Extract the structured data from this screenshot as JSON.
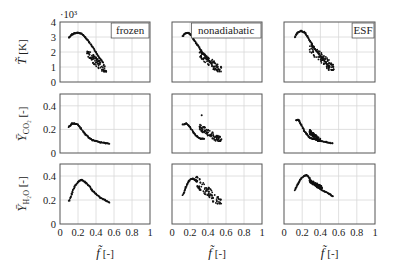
{
  "figure": {
    "columns": [
      "frozen",
      "nonadiabatic",
      "ESF"
    ],
    "row_labels": [
      {
        "symbol": "T",
        "unit": "[K]",
        "exponent": "·10³"
      },
      {
        "symbol": "Y",
        "sub": "CO₂",
        "unit": "[-]"
      },
      {
        "symbol": "Y",
        "sub": "H₂O",
        "unit": "[-]"
      }
    ],
    "x_label": {
      "symbol": "f",
      "unit": "[-]"
    },
    "x_ticks": [
      "0",
      "0.2",
      "0.4",
      "0.6",
      "0.8",
      "1"
    ],
    "y_ticks": [
      [
        "0",
        "1",
        "2",
        "3",
        "4"
      ],
      [
        "0",
        "0.2",
        "0.4"
      ],
      [
        "0",
        "0.2",
        "0.4"
      ]
    ],
    "colors": {
      "points": "#111111",
      "grid": "#d8d8d8",
      "frame": "#555555"
    }
  },
  "chart_data": [
    {
      "type": "scatter",
      "title": "frozen",
      "row": 0,
      "col": 0,
      "xlabel": "f̃ [-]",
      "ylabel": "T̃ [K] ·10³",
      "xlim": [
        0,
        1
      ],
      "ylim": [
        0,
        4
      ],
      "grid": true,
      "legend": "frozen",
      "legend_position": "upper right",
      "curve": [
        [
          0.1,
          2.95
        ],
        [
          0.13,
          3.15
        ],
        [
          0.16,
          3.25
        ],
        [
          0.2,
          3.28
        ],
        [
          0.24,
          3.22
        ],
        [
          0.28,
          3.0
        ],
        [
          0.32,
          2.7
        ],
        [
          0.36,
          2.35
        ],
        [
          0.4,
          2.0
        ],
        [
          0.44,
          1.6
        ],
        [
          0.48,
          1.3
        ]
      ],
      "scatter_region": {
        "x": [
          0.3,
          0.52
        ],
        "y": [
          0.7,
          1.9
        ]
      }
    },
    {
      "type": "scatter",
      "title": "nonadiabatic",
      "row": 0,
      "col": 1,
      "xlim": [
        0,
        1
      ],
      "ylim": [
        0,
        4
      ],
      "grid": true,
      "legend": "nonadiabatic",
      "curve": [
        [
          0.12,
          3.05
        ],
        [
          0.15,
          3.25
        ],
        [
          0.18,
          3.28
        ],
        [
          0.21,
          3.15
        ],
        [
          0.24,
          2.85
        ],
        [
          0.28,
          2.5
        ],
        [
          0.32,
          2.15
        ],
        [
          0.36,
          1.8
        ],
        [
          0.4,
          1.5
        ],
        [
          0.44,
          1.2
        ]
      ],
      "scatter_region": {
        "x": [
          0.3,
          0.55
        ],
        "y": [
          0.7,
          1.9
        ]
      }
    },
    {
      "type": "scatter",
      "title": "ESF",
      "row": 0,
      "col": 2,
      "xlim": [
        0,
        1
      ],
      "ylim": [
        0,
        4
      ],
      "grid": true,
      "legend": "ESF",
      "curve": [
        [
          0.12,
          3.0
        ],
        [
          0.15,
          3.3
        ],
        [
          0.19,
          3.4
        ],
        [
          0.23,
          3.3
        ],
        [
          0.26,
          3.0
        ],
        [
          0.3,
          2.6
        ],
        [
          0.34,
          2.2
        ],
        [
          0.38,
          1.9
        ],
        [
          0.42,
          1.6
        ],
        [
          0.46,
          1.3
        ],
        [
          0.5,
          1.0
        ]
      ],
      "scatter_region": {
        "x": [
          0.28,
          0.55
        ],
        "y": [
          0.8,
          2.3
        ]
      }
    },
    {
      "type": "scatter",
      "row": 1,
      "col": 0,
      "ylabel": "Ȳ_CO2 [-]",
      "xlim": [
        0,
        1
      ],
      "ylim": [
        0,
        0.5
      ],
      "grid": true,
      "curve": [
        [
          0.1,
          0.22
        ],
        [
          0.13,
          0.25
        ],
        [
          0.16,
          0.25
        ],
        [
          0.2,
          0.24
        ],
        [
          0.24,
          0.2
        ],
        [
          0.28,
          0.16
        ],
        [
          0.32,
          0.13
        ],
        [
          0.36,
          0.11
        ],
        [
          0.4,
          0.1
        ],
        [
          0.45,
          0.09
        ],
        [
          0.5,
          0.085
        ],
        [
          0.55,
          0.08
        ]
      ],
      "scatter_region": null
    },
    {
      "type": "scatter",
      "row": 1,
      "col": 1,
      "xlim": [
        0,
        1
      ],
      "ylim": [
        0,
        0.5
      ],
      "grid": true,
      "curve": [
        [
          0.12,
          0.24
        ],
        [
          0.16,
          0.25
        ],
        [
          0.2,
          0.22
        ],
        [
          0.24,
          0.17
        ],
        [
          0.28,
          0.14
        ],
        [
          0.32,
          0.12
        ],
        [
          0.36,
          0.12
        ]
      ],
      "scatter_region": {
        "x": [
          0.3,
          0.55
        ],
        "y": [
          0.1,
          0.22
        ]
      },
      "outliers": [
        [
          0.33,
          0.32
        ]
      ]
    },
    {
      "type": "scatter",
      "row": 1,
      "col": 2,
      "xlim": [
        0,
        1
      ],
      "ylim": [
        0,
        0.5
      ],
      "grid": true,
      "curve": [
        [
          0.13,
          0.28
        ],
        [
          0.16,
          0.28
        ],
        [
          0.19,
          0.24
        ],
        [
          0.22,
          0.19
        ],
        [
          0.25,
          0.16
        ],
        [
          0.28,
          0.13
        ],
        [
          0.32,
          0.12
        ],
        [
          0.36,
          0.11
        ],
        [
          0.42,
          0.1
        ],
        [
          0.48,
          0.09
        ],
        [
          0.54,
          0.08
        ]
      ],
      "scatter_region": {
        "x": [
          0.28,
          0.4
        ],
        "y": [
          0.1,
          0.18
        ]
      }
    },
    {
      "type": "scatter",
      "row": 2,
      "col": 0,
      "ylabel": "Ȳ_H2O [-]",
      "xlim": [
        0,
        1
      ],
      "ylim": [
        0,
        0.5
      ],
      "grid": true,
      "curve": [
        [
          0.1,
          0.19
        ],
        [
          0.13,
          0.25
        ],
        [
          0.16,
          0.31
        ],
        [
          0.2,
          0.35
        ],
        [
          0.24,
          0.37
        ],
        [
          0.28,
          0.35
        ],
        [
          0.32,
          0.32
        ],
        [
          0.36,
          0.28
        ],
        [
          0.4,
          0.25
        ],
        [
          0.45,
          0.22
        ],
        [
          0.5,
          0.2
        ],
        [
          0.55,
          0.18
        ]
      ],
      "scatter_region": null
    },
    {
      "type": "scatter",
      "row": 2,
      "col": 1,
      "xlim": [
        0,
        1
      ],
      "ylim": [
        0,
        0.5
      ],
      "grid": true,
      "curve": [
        [
          0.12,
          0.24
        ],
        [
          0.15,
          0.3
        ],
        [
          0.18,
          0.35
        ],
        [
          0.22,
          0.38
        ],
        [
          0.25,
          0.37
        ],
        [
          0.28,
          0.35
        ]
      ],
      "scatter_region": {
        "x": [
          0.26,
          0.55
        ],
        "y": [
          0.17,
          0.36
        ]
      }
    },
    {
      "type": "scatter",
      "row": 2,
      "col": 2,
      "xlim": [
        0,
        1
      ],
      "ylim": [
        0,
        0.5
      ],
      "grid": true,
      "curve": [
        [
          0.12,
          0.28
        ],
        [
          0.15,
          0.33
        ],
        [
          0.18,
          0.37
        ],
        [
          0.22,
          0.4
        ],
        [
          0.25,
          0.41
        ],
        [
          0.28,
          0.38
        ],
        [
          0.32,
          0.34
        ],
        [
          0.36,
          0.31
        ],
        [
          0.4,
          0.29
        ],
        [
          0.45,
          0.27
        ],
        [
          0.5,
          0.25
        ],
        [
          0.54,
          0.23
        ]
      ],
      "scatter_region": {
        "x": [
          0.28,
          0.42
        ],
        "y": [
          0.3,
          0.36
        ]
      }
    }
  ]
}
